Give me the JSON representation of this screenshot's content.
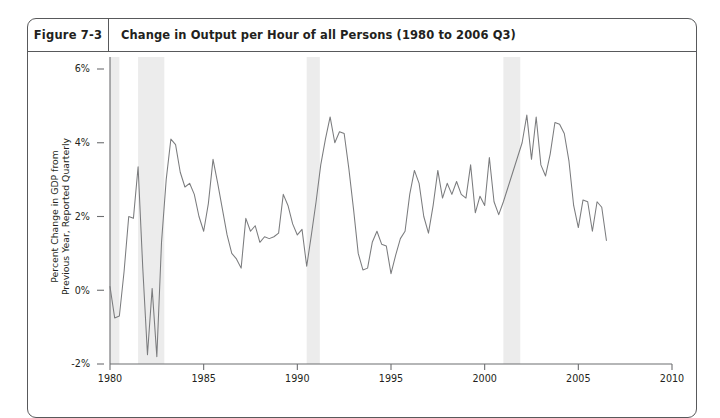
{
  "figure": {
    "number_label": "Figure 7-3",
    "title": "Change in Output per Hour of all Persons (1980 to 2006 Q3)"
  },
  "chart_data": {
    "type": "line",
    "title": "Change in Output per Hour of all Persons (1980 to 2006 Q3)",
    "xlabel": "",
    "ylabel": "Percent Change in GDP from Previous Year, Reported Quarterly",
    "ylabel_line1": "Percent Change in GDP from",
    "ylabel_line2": "Previous Year, Reported Quarterly",
    "xlim": [
      1980,
      2010
    ],
    "ylim": [
      -2,
      6
    ],
    "grid": false,
    "legend": "none",
    "x_tick_labels": [
      "1980",
      "1985",
      "1990",
      "1995",
      "2000",
      "2005",
      "2010"
    ],
    "x_tick_values": [
      1980,
      1985,
      1990,
      1995,
      2000,
      2005,
      2010
    ],
    "y_tick_labels": [
      "-2%",
      "0%",
      "2%",
      "4%",
      "6%"
    ],
    "y_tick_values": [
      -2,
      0,
      2,
      4,
      6
    ],
    "series_name": "Change in Output per Hour of all Persons",
    "line_color": "#7b7c7e",
    "recession_band_color": "#ececec",
    "recession_bands": [
      {
        "start": 1980.0,
        "end": 1980.5
      },
      {
        "start": 1981.5,
        "end": 1982.9
      },
      {
        "start": 1990.5,
        "end": 1991.2
      },
      {
        "start": 2001.0,
        "end": 2001.9
      }
    ],
    "x": [
      1980.0,
      1980.25,
      1980.5,
      1980.75,
      1981.0,
      1981.25,
      1981.5,
      1981.75,
      1982.0,
      1982.25,
      1982.5,
      1982.75,
      1983.0,
      1983.25,
      1983.5,
      1983.75,
      1984.0,
      1984.25,
      1984.5,
      1984.75,
      1985.0,
      1985.25,
      1985.5,
      1985.75,
      1986.0,
      1986.25,
      1986.5,
      1986.75,
      1987.0,
      1987.25,
      1987.5,
      1987.75,
      1988.0,
      1988.25,
      1988.5,
      1988.75,
      1989.0,
      1989.25,
      1989.5,
      1989.75,
      1990.0,
      1990.25,
      1990.5,
      1990.75,
      1991.0,
      1991.25,
      1991.5,
      1991.75,
      1992.0,
      1992.25,
      1992.5,
      1992.75,
      1993.0,
      1993.25,
      1993.5,
      1993.75,
      1994.0,
      1994.25,
      1994.5,
      1994.75,
      1995.0,
      1995.25,
      1995.5,
      1995.75,
      1996.0,
      1996.25,
      1996.5,
      1996.75,
      1997.0,
      1997.25,
      1997.5,
      1997.75,
      1998.0,
      1998.25,
      1998.5,
      1998.75,
      1999.0,
      1999.25,
      1999.5,
      1999.75,
      2000.0,
      2000.25,
      2000.5,
      2000.75,
      2001.0,
      2001.25,
      2001.5,
      2001.75,
      2002.0,
      2002.25,
      2002.5,
      2002.75,
      2003.0,
      2003.25,
      2003.5,
      2003.75,
      2004.0,
      2004.25,
      2004.5,
      2004.75,
      2005.0,
      2005.25,
      2005.5,
      2005.75,
      2006.0,
      2006.25,
      2006.5
    ],
    "values": [
      0.1,
      -0.75,
      -0.7,
      0.5,
      2.0,
      1.95,
      3.35,
      0.6,
      -1.75,
      0.05,
      -1.8,
      1.3,
      3.0,
      4.1,
      3.95,
      3.2,
      2.8,
      2.9,
      2.6,
      2.0,
      1.6,
      2.35,
      3.55,
      2.9,
      2.2,
      1.5,
      1.0,
      0.85,
      0.6,
      1.95,
      1.6,
      1.75,
      1.3,
      1.45,
      1.4,
      1.45,
      1.55,
      2.6,
      2.3,
      1.8,
      1.5,
      1.65,
      0.65,
      1.5,
      2.4,
      3.4,
      4.1,
      4.7,
      4.0,
      4.3,
      4.25,
      3.3,
      2.2,
      1.0,
      0.55,
      0.6,
      1.3,
      1.6,
      1.25,
      1.2,
      0.45,
      0.95,
      1.4,
      1.6,
      2.6,
      3.25,
      2.9,
      2.0,
      1.55,
      2.3,
      3.25,
      2.5,
      2.9,
      2.6,
      2.95,
      2.6,
      2.5,
      3.4,
      2.1,
      2.55,
      2.3,
      3.6,
      2.4,
      2.05,
      2.4,
      2.8,
      3.2,
      3.6,
      4.0,
      4.75,
      3.55,
      4.7,
      3.4,
      3.1,
      3.7,
      4.55,
      4.5,
      4.25,
      3.5,
      2.3,
      1.7,
      2.45,
      2.4,
      1.6,
      2.4,
      2.25,
      1.35
    ]
  }
}
